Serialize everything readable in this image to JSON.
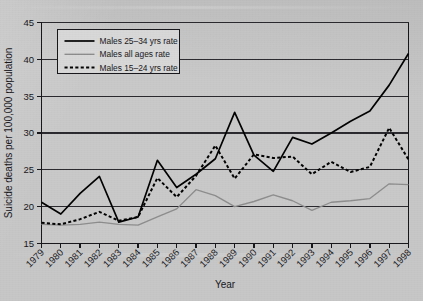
{
  "chart_data": {
    "type": "line",
    "title": "",
    "xlabel": "Year",
    "ylabel": "Suicide deaths per 100,000 population",
    "xlim": [
      1979,
      1998
    ],
    "ylim": [
      15,
      45
    ],
    "yticks": [
      15,
      20,
      25,
      30,
      35,
      40,
      45
    ],
    "grid": true,
    "legend_position": "top-left",
    "x": [
      1979,
      1980,
      1981,
      1982,
      1983,
      1984,
      1985,
      1986,
      1987,
      1988,
      1989,
      1990,
      1991,
      1992,
      1993,
      1994,
      1995,
      1996,
      1997,
      1998
    ],
    "categories": [
      "1979",
      "1980",
      "1981",
      "1982",
      "1983",
      "1984",
      "1985",
      "1986",
      "1987",
      "1988",
      "1989",
      "1990",
      "1991",
      "1992",
      "1993",
      "1994",
      "1995",
      "1996",
      "1997",
      "1998"
    ],
    "series": [
      {
        "name": "Males 25–34 yrs rate",
        "style": "solid",
        "color": "#000000",
        "values": [
          20.6,
          19.0,
          21.8,
          24.1,
          17.9,
          18.6,
          26.3,
          22.6,
          24.4,
          26.5,
          32.8,
          27.0,
          24.8,
          29.4,
          28.5,
          30.0,
          31.6,
          33.0,
          36.5,
          40.8
        ]
      },
      {
        "name": "Males all ages rate",
        "style": "solid",
        "color": "#8d8d8d",
        "values": [
          17.6,
          17.5,
          17.6,
          17.9,
          17.6,
          17.5,
          18.6,
          19.7,
          22.3,
          21.5,
          20.0,
          20.7,
          21.6,
          20.8,
          19.5,
          20.6,
          20.8,
          21.1,
          23.1,
          23.0
        ]
      },
      {
        "name": "Males 15–24 yrs rate",
        "style": "dashed",
        "color": "#000000",
        "values": [
          17.8,
          17.6,
          18.3,
          19.3,
          18.1,
          18.6,
          23.9,
          21.3,
          24.2,
          28.3,
          23.8,
          27.1,
          26.6,
          26.8,
          24.4,
          26.1,
          24.7,
          25.4,
          30.7,
          26.4
        ]
      }
    ]
  },
  "legend": {
    "items": [
      {
        "label": "Males 25–34 yrs rate"
      },
      {
        "label": "Males all ages rate"
      },
      {
        "label": "Males 15–24 yrs rate"
      }
    ]
  },
  "axes": {
    "y_title": "Suicide deaths per 100,000 population",
    "x_title": "Year",
    "y_tick_labels": [
      "15",
      "20",
      "25",
      "30",
      "35",
      "40",
      "45"
    ],
    "x_tick_labels": [
      "1979",
      "1980",
      "1981",
      "1982",
      "1983",
      "1984",
      "1985",
      "1986",
      "1987",
      "1988",
      "1989",
      "1990",
      "1991",
      "1992",
      "1993",
      "1994",
      "1995",
      "1996",
      "1997",
      "1998"
    ]
  },
  "colors": {
    "background": "#c7c7c7",
    "axis": "#16161a",
    "grid": "#2a2a2e",
    "series_primary": "#000000",
    "series_secondary": "#8d8d8d",
    "legend_box": "#d8d8d8"
  }
}
